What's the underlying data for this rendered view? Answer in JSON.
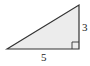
{
  "diagram": {
    "type": "right-triangle",
    "fill_color": "#ececec",
    "stroke_color": "#333333",
    "labels": {
      "base": "5",
      "height": "3"
    },
    "right_angle_marker": true
  }
}
